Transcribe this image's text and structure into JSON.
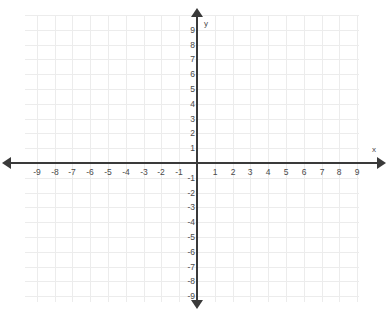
{
  "chart_data": {
    "type": "scatter",
    "title": "",
    "subtitle": "",
    "xlabel": "x",
    "ylabel": "y",
    "xlim": [
      -9,
      9
    ],
    "ylim": [
      -9,
      9
    ],
    "xticks": [
      "-9",
      "-8",
      "-7",
      "-6",
      "-5",
      "-4",
      "-3",
      "-2",
      "-1",
      "1",
      "2",
      "3",
      "4",
      "5",
      "6",
      "7",
      "8",
      "9"
    ],
    "yticks": [
      "9",
      "8",
      "7",
      "6",
      "5",
      "4",
      "3",
      "2",
      "1",
      "-1",
      "-2",
      "-3",
      "-4",
      "-5",
      "-6",
      "-7",
      "-8",
      "-9"
    ],
    "xtick_values": [
      -9,
      -8,
      -7,
      -6,
      -5,
      -4,
      -3,
      -2,
      -1,
      1,
      2,
      3,
      4,
      5,
      6,
      7,
      8,
      9
    ],
    "ytick_values": [
      9,
      8,
      7,
      6,
      5,
      4,
      3,
      2,
      1,
      -1,
      -2,
      -3,
      -4,
      -5,
      -6,
      -7,
      -8,
      -9
    ],
    "grid": true,
    "grid_spacing": 1,
    "legend": null,
    "series": [],
    "values": [],
    "annotations": [],
    "origin_label": ""
  },
  "axes": {
    "x_name": "x",
    "y_name": "y"
  },
  "colors": {
    "background": "#ffffff",
    "grid": "#ececec",
    "axis": "#3a3a3a",
    "tick_text": "#4a4a4a"
  },
  "geometry": {
    "origin_x": 197,
    "origin_y": 163,
    "unit_x": 17.8,
    "unit_y": 14.8
  }
}
